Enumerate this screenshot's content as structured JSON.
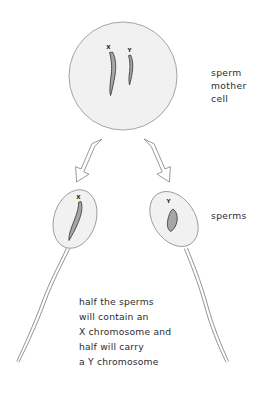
{
  "figure": {
    "background_color": "#ffffff",
    "ink_color": "#2b2b30",
    "cell_fill_color": "#f2f2f2",
    "cell_outline_color": "#9b9b9b",
    "chromosome_fill_color": "#a8a5a2",
    "chromosome_outline_color": "#3a3a3a",
    "arrow_outline_color": "#8e8e8e"
  },
  "mother_cell": {
    "label_lines": [
      "sperm",
      "mother",
      "cell"
    ],
    "label_full": "sperm mother cell",
    "chromosomes": [
      {
        "name": "X",
        "letter": "X"
      },
      {
        "name": "Y",
        "letter": "Y"
      }
    ]
  },
  "arrows": [
    {
      "name": "arrow-left",
      "direction": "down-left"
    },
    {
      "name": "arrow-right",
      "direction": "down-right"
    }
  ],
  "sperms": {
    "label": "sperms",
    "cells": [
      {
        "name": "sperm-x",
        "chromosome_letter": "X"
      },
      {
        "name": "sperm-y",
        "chromosome_letter": "Y"
      }
    ]
  },
  "caption": {
    "lines": [
      "half the sperms",
      "will contain an",
      "X chromosome and",
      "half will carry",
      "a Y chromosome"
    ],
    "full_text": "half the sperms will contain an X chromosome and half will carry a Y chromosome"
  }
}
